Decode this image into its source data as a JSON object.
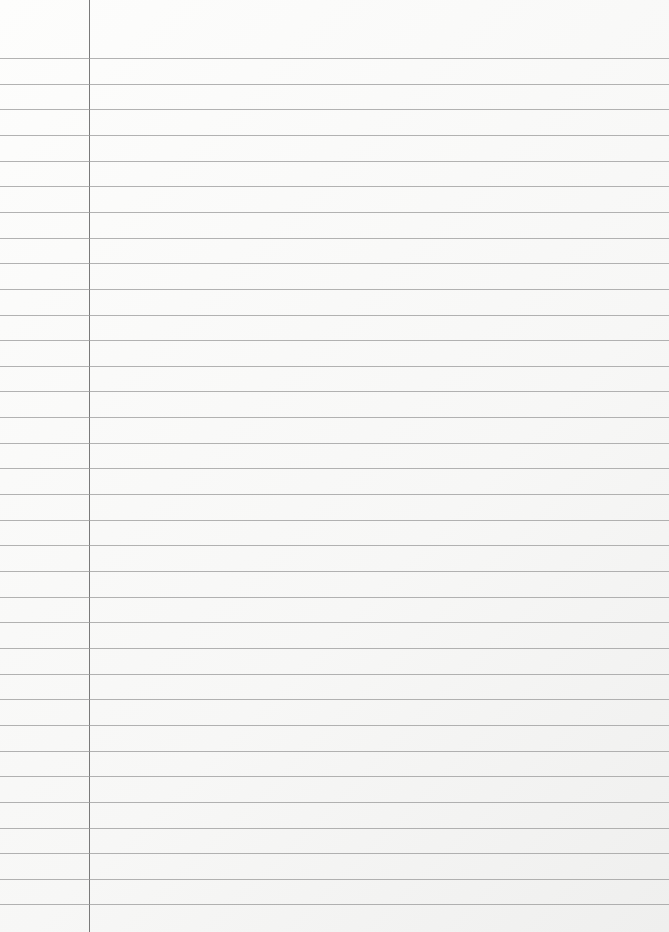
{
  "paper": {
    "type": "ruled-notebook-page",
    "line_count": 34,
    "first_line_y": 58,
    "line_spacing": 25.65,
    "margin_x": 89,
    "colors": {
      "background": "#fbfbfa",
      "rule": "#9a9a9a",
      "margin": "#7a7a7a"
    }
  }
}
